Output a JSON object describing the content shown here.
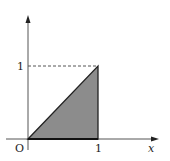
{
  "diagram": {
    "type": "coordinate-plot",
    "axes": {
      "x_label": "x",
      "origin_label": "O",
      "x_tick_label": "1",
      "y_tick_label": "1"
    },
    "region": {
      "vertices": [
        [
          0,
          0
        ],
        [
          1,
          0
        ],
        [
          1,
          1
        ]
      ],
      "fill_color": "#8c8c8c",
      "stroke_color": "#222222"
    },
    "guide_line": {
      "style": "dashed",
      "from": [
        0,
        1
      ],
      "to": [
        1,
        1
      ]
    },
    "colors": {
      "axis": "#555555",
      "text": "#222222"
    }
  }
}
